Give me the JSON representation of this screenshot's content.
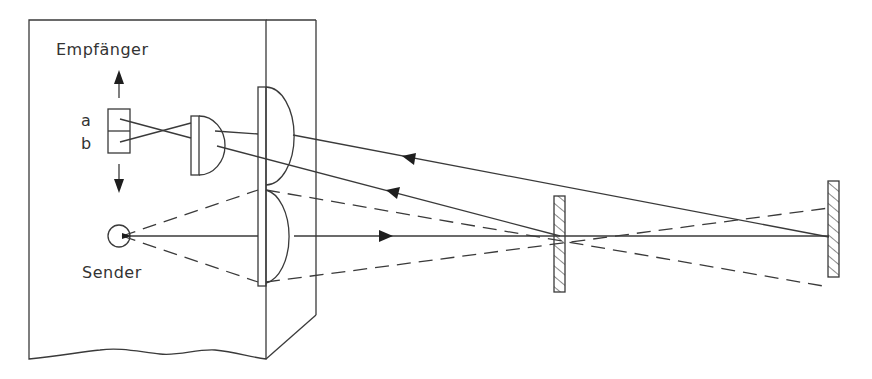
{
  "diagram": {
    "labels": {
      "receiver": "Empfänger",
      "receiver_segment_a": "a",
      "receiver_segment_b": "b",
      "sender": "Sender"
    },
    "components": [
      {
        "id": "housing",
        "name": "Gehäuse"
      },
      {
        "id": "receiver",
        "name": "Empfänger",
        "segments": [
          "a",
          "b"
        ]
      },
      {
        "id": "small-lens",
        "name": "Empfängerlinse"
      },
      {
        "id": "main-lens-upper",
        "name": "Empfangsoptik"
      },
      {
        "id": "main-lens-lower",
        "name": "Sendeoptik"
      },
      {
        "id": "sender",
        "name": "Sender"
      },
      {
        "id": "reflector-near",
        "name": "Reflektor (nah)"
      },
      {
        "id": "reflector-far",
        "name": "Reflektor (fern)"
      }
    ],
    "colors": {
      "line": "#3a3a3a",
      "arrow": "#1e1e1e",
      "background": "#ffffff"
    }
  }
}
